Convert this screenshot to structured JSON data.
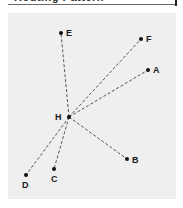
{
  "title": "Routing Pattern",
  "diagram": {
    "hub": {
      "id": "H",
      "x": 69,
      "y": 117,
      "label_x": 55,
      "label_y": 120
    },
    "nodes": [
      {
        "id": "E",
        "x": 61,
        "y": 33,
        "label_x": 66,
        "label_y": 36
      },
      {
        "id": "F",
        "x": 141,
        "y": 39,
        "label_x": 146,
        "label_y": 42
      },
      {
        "id": "A",
        "x": 148,
        "y": 70,
        "label_x": 153,
        "label_y": 73
      },
      {
        "id": "B",
        "x": 127,
        "y": 159,
        "label_x": 132,
        "label_y": 163
      },
      {
        "id": "C",
        "x": 54,
        "y": 169,
        "label_x": 51,
        "label_y": 182
      },
      {
        "id": "D",
        "x": 26,
        "y": 175,
        "label_x": 22,
        "label_y": 188
      }
    ],
    "colors": {
      "panel": "#efefef",
      "line": "#555555",
      "dot": "#111111",
      "label": "#1a1a1a"
    }
  }
}
